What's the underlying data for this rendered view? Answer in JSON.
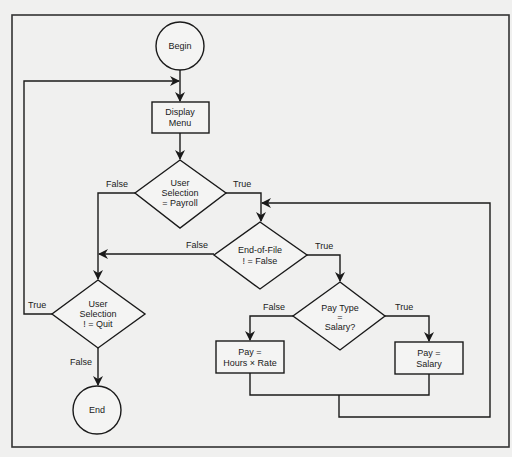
{
  "diagram": {
    "type": "flowchart",
    "nodes": {
      "begin": {
        "shape": "circle",
        "label": "Begin"
      },
      "display_menu": {
        "shape": "rect",
        "lines": [
          "Display",
          "Menu"
        ]
      },
      "user_payroll": {
        "shape": "diamond",
        "lines": [
          "User",
          "Selection",
          "= Payroll"
        ]
      },
      "eof": {
        "shape": "diamond",
        "lines": [
          "End-of-File",
          "! = False"
        ]
      },
      "pay_type": {
        "shape": "diamond",
        "lines": [
          "Pay Type",
          "=",
          "Salary?"
        ]
      },
      "pay_hours": {
        "shape": "rect",
        "lines": [
          "Pay =",
          "Hours × Rate"
        ]
      },
      "pay_salary": {
        "shape": "rect",
        "lines": [
          "Pay =",
          "Salary"
        ]
      },
      "user_quit": {
        "shape": "diamond",
        "lines": [
          "User",
          "Selection",
          "! = Quit"
        ]
      },
      "end": {
        "shape": "circle",
        "label": "End"
      }
    },
    "edge_labels": {
      "payroll_false": "False",
      "payroll_true": "True",
      "eof_false": "False",
      "eof_true": "True",
      "paytype_false": "False",
      "paytype_true": "True",
      "quit_true": "True",
      "quit_false": "False"
    },
    "edges": [
      {
        "from": "begin",
        "to": "display_menu"
      },
      {
        "from": "display_menu",
        "to": "user_payroll"
      },
      {
        "from": "user_payroll",
        "to": "eof",
        "label": "True"
      },
      {
        "from": "user_payroll",
        "to": "user_quit",
        "label": "False"
      },
      {
        "from": "eof",
        "to": "pay_type",
        "label": "True"
      },
      {
        "from": "eof",
        "to": "user_quit",
        "label": "False"
      },
      {
        "from": "pay_type",
        "to": "pay_salary",
        "label": "True"
      },
      {
        "from": "pay_type",
        "to": "pay_hours",
        "label": "False"
      },
      {
        "from": "pay_hours",
        "to": "eof"
      },
      {
        "from": "pay_salary",
        "to": "eof"
      },
      {
        "from": "user_quit",
        "to": "display_menu",
        "label": "True"
      },
      {
        "from": "user_quit",
        "to": "end",
        "label": "False"
      }
    ]
  }
}
